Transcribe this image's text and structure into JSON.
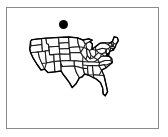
{
  "figure": {
    "kind": "us-states-outline-map",
    "background_color": "#ffffff",
    "frame": {
      "border_color": "#8a8a8a",
      "fill_color": "#ffffff",
      "x": 6,
      "y": 7,
      "width": 153,
      "height": 122
    },
    "caption": "",
    "title": ""
  },
  "marker": {
    "name": "black-dot-marker",
    "shape": "filled-circle",
    "color": "#000000",
    "center_x": 63.5,
    "center_y": 24.5,
    "diameter": 9
  },
  "map": {
    "region": "Contiguous United States",
    "stroke_color": "#1a1a1a",
    "fill_color": "#ffffff",
    "outline_stroke_color": "#000000",
    "bounds": {
      "x": 28,
      "y": 37,
      "width": 118,
      "height": 70
    },
    "shows_state_boundaries": true,
    "states": [
      "Washington",
      "Oregon",
      "California",
      "Nevada",
      "Idaho",
      "Montana",
      "Wyoming",
      "Utah",
      "Arizona",
      "Colorado",
      "New Mexico",
      "North Dakota",
      "South Dakota",
      "Nebraska",
      "Kansas",
      "Oklahoma",
      "Texas",
      "Minnesota",
      "Iowa",
      "Missouri",
      "Arkansas",
      "Louisiana",
      "Wisconsin",
      "Illinois",
      "Mississippi",
      "Michigan",
      "Indiana",
      "Kentucky",
      "Tennessee",
      "Alabama",
      "Ohio",
      "Georgia",
      "Florida",
      "South Carolina",
      "North Carolina",
      "Virginia",
      "West Virginia",
      "Pennsylvania",
      "New York",
      "Maryland",
      "Delaware",
      "New Jersey",
      "Connecticut",
      "Rhode Island",
      "Massachusetts",
      "Vermont",
      "New Hampshire",
      "Maine"
    ]
  }
}
